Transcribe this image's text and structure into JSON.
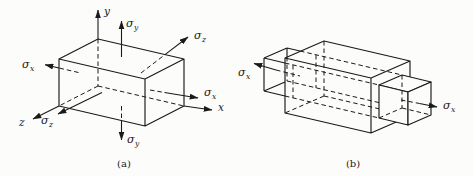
{
  "figure": {
    "paper_color": "#fcfcfa",
    "ink_color": "#1a1a1a",
    "diagram_a": {
      "caption": "(a)",
      "axes": {
        "x": "x",
        "y": "y",
        "z": "z"
      },
      "stresses": {
        "sigma_y_top": {
          "symbol": "σ",
          "subscript": "y"
        },
        "sigma_y_bottom": {
          "symbol": "σ",
          "subscript": "y"
        },
        "sigma_x_left": {
          "symbol": "σ",
          "subscript": "x"
        },
        "sigma_x_right": {
          "symbol": "σ",
          "subscript": "x"
        },
        "sigma_z_front": {
          "symbol": "σ",
          "subscript": "z"
        },
        "sigma_z_back": {
          "symbol": "σ",
          "subscript": "z"
        }
      }
    },
    "diagram_b": {
      "caption": "(b)",
      "stresses": {
        "sigma_x_left": {
          "symbol": "σ",
          "subscript": "x"
        },
        "sigma_x_right": {
          "symbol": "σ",
          "subscript": "x"
        }
      }
    }
  }
}
